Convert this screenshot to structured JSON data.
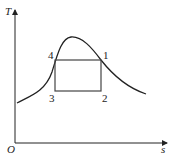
{
  "diagram": {
    "type": "T-s diagram",
    "axes": {
      "y_label": "T",
      "x_label": "s",
      "origin_label": "O"
    },
    "points": [
      {
        "id": "1",
        "label": "1"
      },
      {
        "id": "2",
        "label": "2"
      },
      {
        "id": "3",
        "label": "3"
      },
      {
        "id": "4",
        "label": "4"
      }
    ],
    "colors": {
      "line": "#222222",
      "cycle": "#444444",
      "background": "#ffffff"
    }
  }
}
